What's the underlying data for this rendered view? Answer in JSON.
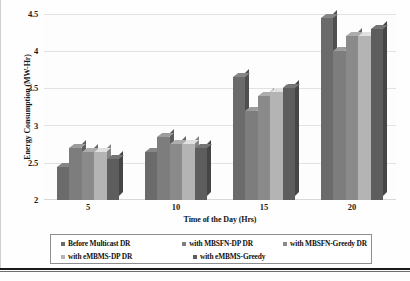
{
  "chart_data": {
    "type": "bar",
    "title": "",
    "xlabel": "Time of the Day (Hrs)",
    "ylabel": "Energy Consumption (MW-Hr)",
    "categories": [
      "5",
      "10",
      "15",
      "20"
    ],
    "ylim": [
      2,
      4.5
    ],
    "yticks": [
      "2",
      "2.5",
      "3",
      "3.5",
      "4",
      "4.5"
    ],
    "grid": true,
    "legend_position": "bottom",
    "series": [
      {
        "name": "Before Multicast DR",
        "color": "#6b6b6b",
        "values": [
          2.45,
          2.65,
          3.65,
          4.45
        ]
      },
      {
        "name": "with MBSFN-DP DR",
        "color": "#7d7d7d",
        "values": [
          2.7,
          2.85,
          3.2,
          4.0
        ]
      },
      {
        "name": "with MBSFN-Greedy DR",
        "color": "#8a8a8a",
        "values": [
          2.65,
          2.75,
          3.4,
          4.2
        ]
      },
      {
        "name": "with eMBMS-DP DR",
        "color": "#b4b4b4",
        "values": [
          2.65,
          2.75,
          3.45,
          4.2
        ]
      },
      {
        "name": "with eMBMS-Greedy",
        "color": "#5d5d5d",
        "values": [
          2.55,
          2.7,
          3.5,
          4.3
        ]
      }
    ]
  }
}
